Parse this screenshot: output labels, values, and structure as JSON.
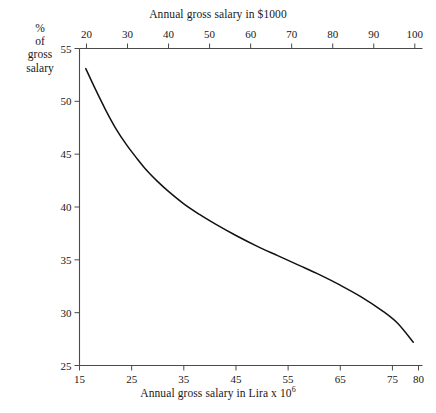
{
  "chart_data": {
    "type": "line",
    "title": "",
    "xlabel": "Annual gross salary in Lira x 10^6",
    "xlabel_top": "Annual gross salary in $1000",
    "ylabel": "% of gross salary",
    "grid": false,
    "legend": "none",
    "x_axis_top": {
      "label": "Annual gross salary in $1000",
      "ticks": [
        20,
        30,
        40,
        50,
        60,
        70,
        80,
        90,
        100
      ],
      "tick_labels": [
        "20",
        "30",
        "40",
        "50",
        "60",
        "70",
        "80",
        "90",
        "100"
      ],
      "range": [
        18.3,
        100.9
      ]
    },
    "x_axis_bottom": {
      "label": "Annual gross salary in Lira x 10",
      "label_exponent": "6",
      "ticks": [
        15,
        25,
        35,
        45,
        55,
        65,
        75,
        80
      ],
      "tick_labels": [
        "15",
        "25",
        "35",
        "45",
        "55",
        "65",
        "75",
        "80"
      ],
      "range": [
        15,
        80
      ]
    },
    "y_axis": {
      "label_lines": [
        "%",
        "of",
        "gross",
        "salary"
      ],
      "ticks": [
        25,
        30,
        35,
        40,
        45,
        50,
        55
      ],
      "tick_labels": [
        "25",
        "30",
        "35",
        "40",
        "45",
        "50",
        "55"
      ],
      "range": [
        25,
        55
      ]
    },
    "series": [
      {
        "name": "Effective tax rate",
        "x_units": "Lira x 10^6",
        "y_units": "% of gross salary",
        "x": [
          16.2,
          18,
          20,
          22,
          24,
          26,
          28,
          30,
          32,
          35,
          38,
          41,
          45,
          49,
          53,
          57,
          61,
          65,
          69,
          73,
          76,
          79
        ],
        "y": [
          53.1,
          51.2,
          49.2,
          47.4,
          45.9,
          44.6,
          43.4,
          42.4,
          41.5,
          40.3,
          39.3,
          38.4,
          37.3,
          36.3,
          35.4,
          34.5,
          33.6,
          32.6,
          31.5,
          30.2,
          29.0,
          27.2
        ]
      }
    ]
  },
  "labels": {
    "top_axis_title": "Annual gross salary in $1000",
    "bottom_axis_title_main": "Annual gross salary in Lira x 10",
    "bottom_axis_title_sup": "6",
    "y_title_line1": "%",
    "y_title_line2": "of",
    "y_title_line3": "gross",
    "y_title_line4": "salary"
  }
}
